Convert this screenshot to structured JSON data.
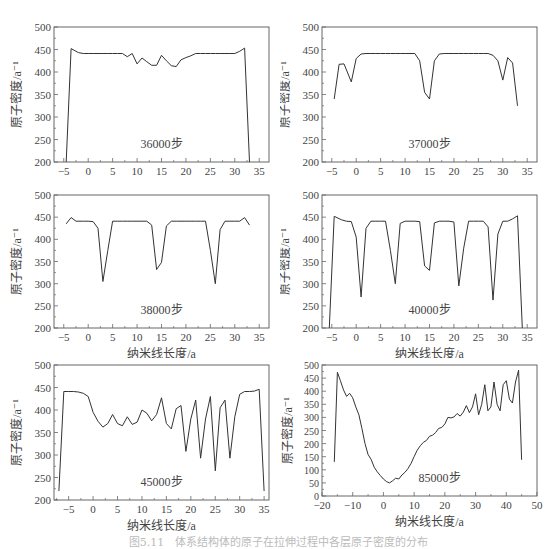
{
  "figure": {
    "caption": "图5.11　体系结构体的原子在拉伸过程中各层原子密度的分布"
  },
  "chart_data": [
    {
      "type": "line",
      "label": "36000步",
      "xlabel": "纳米线长度/a",
      "ylabel": "原子密度/a⁻¹",
      "xlim": [
        -7,
        37
      ],
      "ylim": [
        200,
        500
      ],
      "xticks": [
        -5,
        0,
        5,
        10,
        15,
        20,
        25,
        30,
        35
      ],
      "yticks": [
        200,
        250,
        300,
        350,
        400,
        450,
        500
      ],
      "x": [
        -4.5,
        -3.5,
        -2,
        -1,
        0,
        1,
        2,
        3,
        4,
        5,
        6,
        7,
        8,
        9,
        10,
        11,
        12,
        13,
        14,
        15,
        16,
        17,
        18,
        19,
        20,
        21,
        22,
        23,
        24,
        25,
        26,
        27,
        28,
        29,
        30,
        31,
        32,
        33
      ],
      "y": [
        200,
        452,
        443,
        441,
        441,
        441,
        441,
        441,
        441,
        441,
        441,
        441,
        434,
        441,
        418,
        431,
        423,
        415,
        415,
        437,
        425,
        414,
        412,
        427,
        432,
        436,
        441,
        441,
        441,
        441,
        441,
        441,
        441,
        441,
        441,
        446,
        453,
        200
      ]
    },
    {
      "type": "line",
      "label": "37000步",
      "xlabel": "纳米线长度/a",
      "ylabel": "原子密度/a⁻¹",
      "xlim": [
        -7,
        37
      ],
      "ylim": [
        200,
        500
      ],
      "xticks": [
        -5,
        0,
        5,
        10,
        15,
        20,
        25,
        30,
        35
      ],
      "yticks": [
        200,
        250,
        300,
        350,
        400,
        450,
        500
      ],
      "x": [
        -4.5,
        -3.5,
        -2.5,
        -1,
        0,
        1,
        2,
        3,
        4,
        5,
        6,
        7,
        8,
        9,
        10,
        11,
        12,
        13,
        14,
        15,
        16,
        17,
        18,
        19,
        20,
        21,
        22,
        23,
        24,
        25,
        26,
        27,
        28,
        29,
        30,
        31,
        32,
        33
      ],
      "y": [
        340,
        417,
        418,
        378,
        430,
        440,
        441,
        441,
        441,
        441,
        441,
        441,
        441,
        441,
        441,
        441,
        441,
        425,
        355,
        340,
        425,
        440,
        441,
        441,
        441,
        441,
        441,
        441,
        441,
        441,
        441,
        441,
        437,
        425,
        382,
        432,
        420,
        325
      ]
    },
    {
      "type": "line",
      "label": "38000步",
      "xlabel": "纳米线长度/a",
      "ylabel": "原子密度/a⁻¹",
      "xlim": [
        -7,
        37
      ],
      "ylim": [
        200,
        500
      ],
      "xticks": [
        -5,
        0,
        5,
        10,
        15,
        20,
        25,
        30,
        35
      ],
      "yticks": [
        200,
        250,
        300,
        350,
        400,
        450,
        500
      ],
      "x": [
        -4.5,
        -3.5,
        -2.5,
        -1,
        0,
        1,
        2,
        3,
        4,
        5,
        6,
        7,
        8,
        9,
        10,
        11,
        12,
        13,
        14,
        15,
        16,
        17,
        18,
        19,
        20,
        21,
        22,
        23,
        24,
        25,
        26,
        27,
        28,
        29,
        30,
        31,
        32,
        33
      ],
      "y": [
        435,
        449,
        441,
        441,
        441,
        440,
        425,
        305,
        375,
        441,
        441,
        441,
        441,
        441,
        441,
        441,
        441,
        432,
        332,
        348,
        430,
        441,
        441,
        441,
        441,
        441,
        441,
        441,
        441,
        375,
        300,
        422,
        441,
        441,
        441,
        441,
        449,
        432
      ]
    },
    {
      "type": "line",
      "label": "40000步",
      "xlabel": "纳米线长度/a",
      "ylabel": "原子密度/a⁻¹",
      "xlim": [
        -7,
        37
      ],
      "ylim": [
        200,
        500
      ],
      "xticks": [
        -5,
        0,
        5,
        10,
        15,
        20,
        25,
        30,
        35
      ],
      "yticks": [
        200,
        250,
        300,
        350,
        400,
        450,
        500
      ],
      "x": [
        -5.5,
        -4.5,
        -3,
        -2,
        -1,
        0,
        1,
        2,
        3,
        4,
        5,
        6,
        7,
        8,
        9,
        10,
        11,
        12,
        13,
        14,
        15,
        16,
        17,
        18,
        19,
        20,
        21,
        22,
        23,
        24,
        25,
        26,
        27,
        28,
        29,
        30,
        31,
        32,
        33,
        34
      ],
      "y": [
        200,
        452,
        444,
        441,
        440,
        405,
        270,
        425,
        441,
        441,
        441,
        441,
        375,
        300,
        436,
        441,
        441,
        441,
        440,
        340,
        330,
        437,
        441,
        441,
        441,
        439,
        295,
        380,
        441,
        441,
        441,
        441,
        428,
        263,
        412,
        441,
        441,
        446,
        453,
        200
      ]
    },
    {
      "type": "line",
      "label": "45000步",
      "xlabel": "纳米线长度/a",
      "ylabel": "原子密度/a⁻¹",
      "xlim": [
        -8,
        36
      ],
      "ylim": [
        200,
        500
      ],
      "xticks": [
        -5,
        0,
        5,
        10,
        15,
        20,
        25,
        30,
        35
      ],
      "yticks": [
        200,
        250,
        300,
        350,
        400,
        450,
        500
      ],
      "x": [
        -7,
        -6,
        -5,
        -4,
        -3,
        -2,
        -1,
        0,
        1,
        2,
        3,
        4,
        5,
        6,
        7,
        8,
        9,
        10,
        11,
        12,
        13,
        14,
        15,
        16,
        17,
        18,
        19,
        20,
        21,
        22,
        23,
        24,
        25,
        26,
        27,
        28,
        29,
        30,
        31,
        32,
        33,
        34,
        35
      ],
      "y": [
        220,
        441,
        441,
        441,
        440,
        437,
        430,
        395,
        375,
        362,
        370,
        390,
        370,
        365,
        385,
        368,
        373,
        400,
        393,
        376,
        390,
        427,
        370,
        358,
        403,
        410,
        308,
        380,
        422,
        293,
        380,
        430,
        265,
        405,
        422,
        293,
        385,
        435,
        441,
        441,
        442,
        446,
        220
      ]
    },
    {
      "type": "line",
      "label": "85000步",
      "xlabel": "纳米线长度/a",
      "ylabel": "原子密度/a⁻¹",
      "xlim": [
        -20,
        50
      ],
      "ylim": [
        0,
        500
      ],
      "xticks": [
        -20,
        -10,
        0,
        10,
        20,
        30,
        40,
        50
      ],
      "yticks": [
        0,
        50,
        100,
        150,
        200,
        250,
        300,
        350,
        400,
        450,
        500
      ],
      "x": [
        -16,
        -15,
        -14,
        -13,
        -12,
        -11,
        -10,
        -9,
        -8,
        -7,
        -6,
        -5,
        -4,
        -3,
        -2,
        -1,
        0,
        1,
        2,
        3,
        4,
        5,
        6,
        7,
        8,
        9,
        10,
        11,
        12,
        13,
        14,
        15,
        16,
        17,
        18,
        19,
        20,
        21,
        22,
        23,
        24,
        25,
        26,
        27,
        28,
        29,
        30,
        31,
        32,
        33,
        34,
        35,
        36,
        37,
        38,
        39,
        40,
        41,
        42,
        43,
        44,
        45
      ],
      "y": [
        130,
        472,
        440,
        405,
        380,
        392,
        375,
        340,
        310,
        258,
        200,
        158,
        140,
        110,
        92,
        78,
        65,
        55,
        50,
        58,
        68,
        65,
        80,
        90,
        105,
        125,
        150,
        175,
        192,
        205,
        212,
        228,
        232,
        242,
        258,
        262,
        275,
        300,
        298,
        302,
        315,
        305,
        320,
        345,
        318,
        340,
        390,
        310,
        350,
        425,
        325,
        340,
        435,
        350,
        325,
        425,
        440,
        370,
        355,
        435,
        480,
        138
      ]
    }
  ]
}
